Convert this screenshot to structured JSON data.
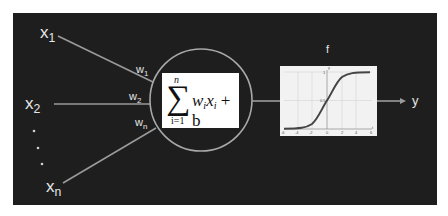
{
  "diagram": {
    "inputs": [
      {
        "name": "x",
        "sub": "1"
      },
      {
        "name": "x",
        "sub": "2"
      },
      {
        "name": "x",
        "sub": "n"
      }
    ],
    "ellipsis": "·  ·  ·",
    "weights": [
      {
        "name": "w",
        "sub": "1"
      },
      {
        "name": "w",
        "sub": "2"
      },
      {
        "name": "w",
        "sub": "n"
      }
    ],
    "summation": {
      "symbol": "∑",
      "upper": "n",
      "lower": "i=1",
      "expression_w": "w",
      "expression_w_sub": "i",
      "expression_x": "x",
      "expression_x_sub": "i",
      "expression_tail": " + b"
    },
    "activation": {
      "label": "f",
      "type": "sigmoid",
      "x_ticks": [
        "-6",
        "-4",
        "-2",
        "0",
        "2",
        "4",
        "6"
      ],
      "y_ticks": [
        "0",
        "0.5",
        "1"
      ],
      "x_axis_label": "t",
      "y_axis_label": "y"
    },
    "output": {
      "label": "y"
    },
    "colors": {
      "background": "#1e1e1e",
      "lines": "#9a9a9a",
      "text": "#e6e6e6",
      "box": "#ffffff",
      "curve": "#444444"
    }
  }
}
